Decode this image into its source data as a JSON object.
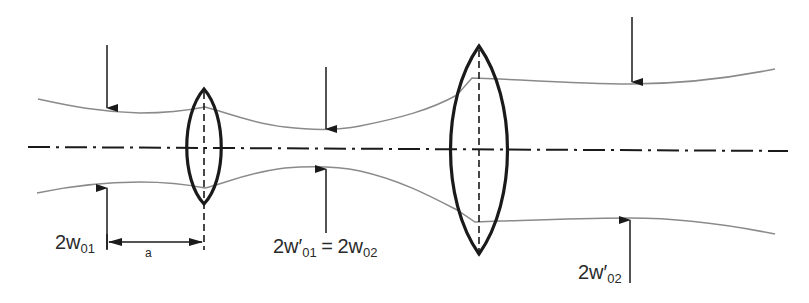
{
  "diagram": {
    "colors": {
      "beam": "#8a8a8a",
      "lens": "#1a1a1a",
      "axis": "#1a1a1a",
      "arrow": "#1a1a1a",
      "text": "#2a2a2a"
    },
    "labels": {
      "waist1": {
        "prefix": "2w",
        "sub": "01"
      },
      "distance": "a",
      "waist_mid": {
        "left_prefix": "2w′",
        "left_sub": "01",
        "equals": "=",
        "right_prefix": "2w",
        "right_sub": "02"
      },
      "waist2": {
        "prefix": "2w′",
        "sub": "02"
      }
    },
    "elements": {
      "optical_axis": "dash-dot line",
      "lens1": "small biconvex lens",
      "lens2": "large biconvex lens",
      "beam_envelope": "upper and lower beam profile curves"
    }
  }
}
